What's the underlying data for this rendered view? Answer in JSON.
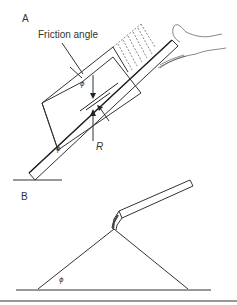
{
  "panel_a": {
    "label": "A",
    "friction_angle_label": "Friction angle",
    "phi_symbol": "ϕ",
    "reaction_label": "R",
    "base_phi_symbol": "ϕ"
  },
  "panel_b": {
    "label": "B",
    "phi_symbol": "ϕ"
  }
}
